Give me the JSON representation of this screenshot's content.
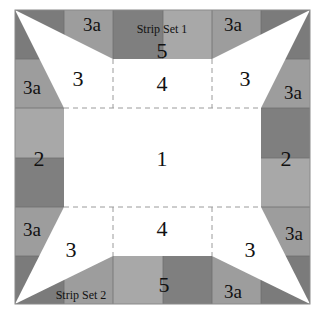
{
  "colors": {
    "dark": "#7b7b7b",
    "medium": "#9d9d9d",
    "light": "#b2b2b2",
    "white": "#ffffff",
    "dash": "#9a9a9a"
  },
  "labels": {
    "center": "1",
    "side_left": "2",
    "side_right": "2",
    "corner_tl": "3",
    "corner_tr": "3",
    "corner_bl": "3",
    "corner_br": "3",
    "top_mid": "4",
    "bottom_mid": "4",
    "top_strip": "5",
    "bottom_strip": "5",
    "strip_set_1": "Strip Set 1",
    "strip_set_2": "Strip Set 2",
    "a_top_left": "3a",
    "a_top_right": "3a",
    "a_left_top": "3a",
    "a_right_top": "3a",
    "a_left_bottom": "3a",
    "a_right_bottom": "3a",
    "a_bottom_right": "3a"
  }
}
